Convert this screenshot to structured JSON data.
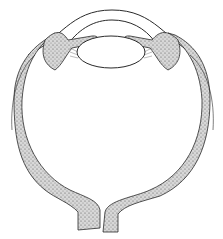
{
  "figure": {
    "parts": [
      "cornea",
      "lens",
      "ciliary-body",
      "iris",
      "sclera",
      "optic-nerve"
    ],
    "colors": {
      "ink": "#2a2a2a",
      "tissue": "#b8b8b8",
      "background": "#ffffff"
    }
  }
}
